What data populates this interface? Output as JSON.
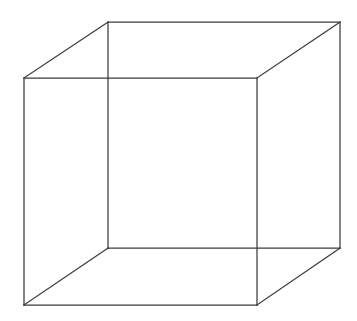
{
  "figure": {
    "name": "Necker cube",
    "type": "wireframe-line-drawing",
    "projection": "oblique parallel projection",
    "hidden_line_removal": false,
    "ambiguous": true,
    "canvas": {
      "width": 357,
      "height": 321,
      "background_color": "#ffffff"
    },
    "stroke": {
      "color": "#3a3a3a",
      "width": 1.25
    },
    "vertices": {
      "front_top_left": [
        24,
        78
      ],
      "front_top_right": [
        257,
        78
      ],
      "front_bottom_right": [
        257,
        305
      ],
      "front_bottom_left": [
        24,
        305
      ],
      "back_top_left": [
        108,
        22
      ],
      "back_top_right": [
        340,
        22
      ],
      "back_bottom_right": [
        340,
        248
      ],
      "back_bottom_left": [
        108,
        248
      ]
    },
    "depth_offset": [
      84,
      -56
    ],
    "faces": {
      "front_square": [
        [
          24,
          78
        ],
        [
          257,
          78
        ],
        [
          257,
          305
        ],
        [
          24,
          305
        ]
      ],
      "back_square": [
        [
          108,
          22
        ],
        [
          340,
          22
        ],
        [
          340,
          248
        ],
        [
          108,
          248
        ]
      ]
    },
    "edges": [
      {
        "id": "front-top",
        "label": "front face top edge",
        "from": "front_top_left",
        "to": "front_top_right",
        "path": "M 24 78 L 257 78"
      },
      {
        "id": "front-right",
        "label": "front face right edge",
        "from": "front_top_right",
        "to": "front_bottom_right",
        "path": "M 257 78 L 257 305"
      },
      {
        "id": "front-bottom",
        "label": "front face bottom edge",
        "from": "front_bottom_right",
        "to": "front_bottom_left",
        "path": "M 257 305 L 24 305"
      },
      {
        "id": "front-left",
        "label": "front face left edge",
        "from": "front_bottom_left",
        "to": "front_top_left",
        "path": "M 24 305 L 24 78"
      },
      {
        "id": "back-top",
        "label": "back face top edge",
        "from": "back_top_left",
        "to": "back_top_right",
        "path": "M 108 22 L 340 22"
      },
      {
        "id": "back-right",
        "label": "back face right edge",
        "from": "back_top_right",
        "to": "back_bottom_right",
        "path": "M 340 22 L 340 248"
      },
      {
        "id": "back-bottom",
        "label": "back face bottom edge",
        "from": "back_bottom_right",
        "to": "back_bottom_left",
        "path": "M 340 248 L 108 248"
      },
      {
        "id": "back-left",
        "label": "back face left edge",
        "from": "back_bottom_left",
        "to": "back_top_left",
        "path": "M 108 248 L 108 22"
      },
      {
        "id": "connector-top-left",
        "label": "top left depth connector",
        "from": "front_top_left",
        "to": "back_top_left",
        "path": "M 24 78 L 108 22"
      },
      {
        "id": "connector-top-right",
        "label": "top right depth connector",
        "from": "front_top_right",
        "to": "back_top_right",
        "path": "M 257 78 L 340 22"
      },
      {
        "id": "connector-bottom-right",
        "label": "bottom right depth connector",
        "from": "front_bottom_right",
        "to": "back_bottom_right",
        "path": "M 257 305 L 340 248"
      },
      {
        "id": "connector-bottom-left",
        "label": "bottom left depth connector",
        "from": "front_bottom_left",
        "to": "back_bottom_left",
        "path": "M 24 305 L 108 248"
      }
    ],
    "edge_count": 12,
    "vertex_count": 8,
    "face_count": 6
  }
}
